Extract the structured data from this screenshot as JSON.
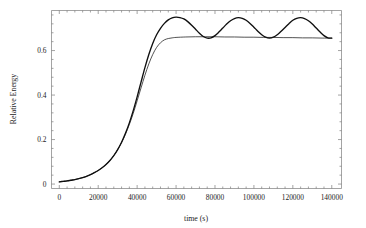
{
  "chart_data": {
    "type": "line",
    "title": "",
    "xlabel": "time (s)",
    "ylabel": "Relative Energy",
    "xlim": [
      -4000,
      145000
    ],
    "ylim": [
      -0.02,
      0.78
    ],
    "grid": false,
    "legend": "none",
    "xticks": [
      0,
      20000,
      40000,
      60000,
      80000,
      100000,
      120000,
      140000
    ],
    "xtick_labels": [
      "0",
      "20000",
      "40000",
      "60000",
      "80000",
      "100000",
      "120000",
      "140000"
    ],
    "yticks": [
      0,
      0.2,
      0.4,
      0.6
    ],
    "ytick_labels": [
      "0",
      "0.2",
      "0.4",
      "0.6"
    ],
    "series": [
      {
        "name": "oscillating",
        "style": "thick-black",
        "x": [
          0,
          2000,
          4000,
          6000,
          8000,
          10000,
          12000,
          14000,
          16000,
          18000,
          20000,
          22000,
          24000,
          26000,
          28000,
          30000,
          32000,
          34000,
          36000,
          38000,
          40000,
          42000,
          44000,
          46000,
          48000,
          50000,
          52000,
          54000,
          56000,
          58000,
          60000,
          62000,
          64000,
          66000,
          68000,
          70000,
          72000,
          74000,
          76000,
          78000,
          80000,
          82000,
          84000,
          86000,
          88000,
          90000,
          92000,
          94000,
          96000,
          98000,
          100000,
          102000,
          104000,
          106000,
          108000,
          110000,
          112000,
          114000,
          116000,
          118000,
          120000,
          122000,
          124000,
          126000,
          128000,
          130000,
          132000,
          134000,
          136000,
          138000,
          140000
        ],
        "y": [
          0.01,
          0.012,
          0.014,
          0.017,
          0.02,
          0.024,
          0.029,
          0.035,
          0.042,
          0.051,
          0.061,
          0.073,
          0.088,
          0.106,
          0.128,
          0.155,
          0.188,
          0.228,
          0.275,
          0.33,
          0.392,
          0.458,
          0.523,
          0.582,
          0.632,
          0.671,
          0.7,
          0.722,
          0.738,
          0.747,
          0.75,
          0.748,
          0.742,
          0.73,
          0.714,
          0.696,
          0.678,
          0.663,
          0.656,
          0.657,
          0.667,
          0.683,
          0.701,
          0.719,
          0.734,
          0.744,
          0.748,
          0.745,
          0.736,
          0.722,
          0.705,
          0.687,
          0.671,
          0.66,
          0.656,
          0.66,
          0.671,
          0.687,
          0.704,
          0.721,
          0.736,
          0.745,
          0.748,
          0.744,
          0.734,
          0.719,
          0.701,
          0.683,
          0.667,
          0.657,
          0.656
        ]
      },
      {
        "name": "saturating",
        "style": "thin-black",
        "x": [
          0,
          2000,
          4000,
          6000,
          8000,
          10000,
          12000,
          14000,
          16000,
          18000,
          20000,
          22000,
          24000,
          26000,
          28000,
          30000,
          32000,
          34000,
          36000,
          38000,
          40000,
          42000,
          44000,
          46000,
          48000,
          50000,
          52000,
          54000,
          56000,
          58000,
          60000,
          65000,
          70000,
          75000,
          80000,
          85000,
          90000,
          95000,
          100000,
          105000,
          110000,
          115000,
          120000,
          125000,
          130000,
          135000,
          140000
        ],
        "y": [
          0.01,
          0.012,
          0.014,
          0.017,
          0.02,
          0.024,
          0.029,
          0.035,
          0.042,
          0.051,
          0.061,
          0.073,
          0.088,
          0.106,
          0.128,
          0.155,
          0.186,
          0.224,
          0.268,
          0.318,
          0.374,
          0.432,
          0.489,
          0.54,
          0.582,
          0.614,
          0.635,
          0.648,
          0.654,
          0.657,
          0.659,
          0.661,
          0.662,
          0.662,
          0.662,
          0.661,
          0.661,
          0.66,
          0.66,
          0.659,
          0.659,
          0.658,
          0.658,
          0.657,
          0.657,
          0.656,
          0.656
        ]
      }
    ],
    "colors": {
      "curve_oscillating": "#0f0f0f",
      "curve_saturating": "#1a1a1a",
      "frame": "#7d7d7d",
      "background": "#ffffff"
    }
  }
}
